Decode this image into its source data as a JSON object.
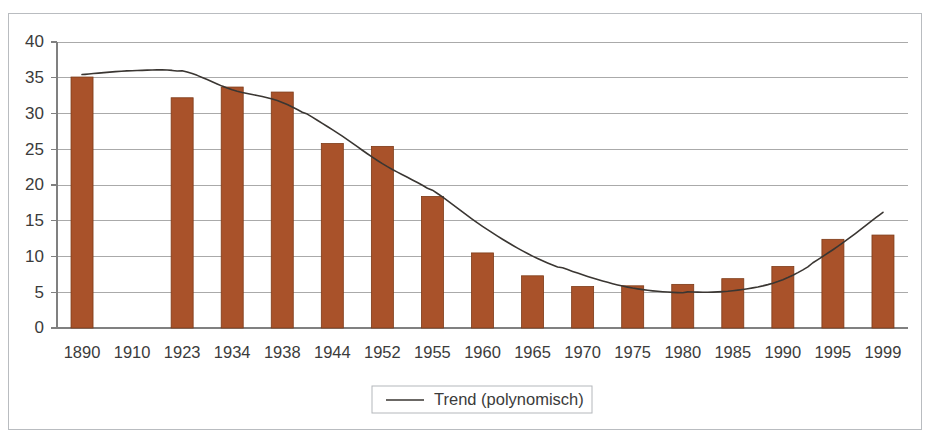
{
  "chart_data": {
    "type": "bar",
    "title": "",
    "subtitle": "",
    "xlabel": "",
    "ylabel": "",
    "ylim": [
      0,
      40
    ],
    "ytick_step": 5,
    "yticks": [
      "0",
      "5",
      "10",
      "15",
      "20",
      "25",
      "30",
      "35",
      "40"
    ],
    "grid": true,
    "legend_position": "bottom-center",
    "categories": [
      "1890",
      "1910",
      "1923",
      "1934",
      "1938",
      "1944",
      "1952",
      "1955",
      "1960",
      "1965",
      "1970",
      "1975",
      "1980",
      "1985",
      "1990",
      "1995",
      "1999"
    ],
    "values": [
      35.1,
      null,
      32.2,
      33.7,
      33.0,
      25.8,
      25.4,
      18.4,
      10.5,
      7.3,
      5.8,
      5.9,
      6.1,
      6.9,
      8.6,
      12.4,
      13.0
    ],
    "bar_color": "#A9522A",
    "bar_edge_color": "#7D3A17",
    "series": [
      {
        "name": "Bars",
        "type": "bar",
        "values": [
          35.1,
          null,
          32.2,
          33.7,
          33.0,
          25.8,
          25.4,
          18.4,
          10.5,
          7.3,
          5.8,
          5.9,
          6.1,
          6.9,
          8.6,
          12.4,
          13.0
        ]
      },
      {
        "name": "Trend (polynomisch)",
        "type": "line",
        "color": "#3A3632",
        "values": [
          35.4,
          36.0,
          35.9,
          33.3,
          31.6,
          27.7,
          23.0,
          19.2,
          14.2,
          10.1,
          7.4,
          5.6,
          5.0,
          5.2,
          6.8,
          10.9,
          16.2
        ]
      }
    ],
    "legend": [
      {
        "label": "Trend (polynomisch)",
        "marker": "line",
        "color": "#3A3632"
      }
    ],
    "annotations": []
  },
  "legend": {
    "trend_label": "Trend (polynomisch)"
  },
  "axes": {
    "y_tick_0": "0",
    "y_tick_5": "5",
    "y_tick_10": "10",
    "y_tick_15": "15",
    "y_tick_20": "20",
    "y_tick_25": "25",
    "y_tick_30": "30",
    "y_tick_35": "35",
    "y_tick_40": "40",
    "x_tick_0": "1890",
    "x_tick_1": "1910",
    "x_tick_2": "1923",
    "x_tick_3": "1934",
    "x_tick_4": "1938",
    "x_tick_5": "1944",
    "x_tick_6": "1952",
    "x_tick_7": "1955",
    "x_tick_8": "1960",
    "x_tick_9": "1965",
    "x_tick_10": "1970",
    "x_tick_11": "1975",
    "x_tick_12": "1980",
    "x_tick_13": "1985",
    "x_tick_14": "1990",
    "x_tick_15": "1995",
    "x_tick_16": "1999"
  }
}
